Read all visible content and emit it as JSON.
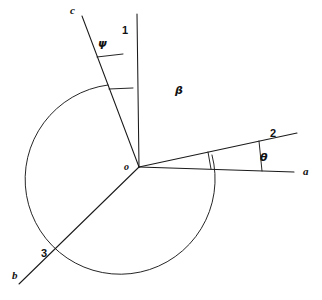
{
  "figure": {
    "type": "geometry-angle-diagram",
    "background_color": "#ffffff",
    "line_color": "#1a1a1a",
    "width": 322,
    "height": 300
  },
  "vertex": {
    "label": "o",
    "x": 139,
    "y": 167
  },
  "rays": [
    {
      "id": "ray-a",
      "label": "a",
      "label_x": 303,
      "label_y": 166,
      "x1": 139,
      "y1": 167,
      "x2": 294,
      "y2": 172
    },
    {
      "id": "ray-2",
      "label": "2",
      "label_x": 270,
      "label_y": 128,
      "x1": 139,
      "y1": 167,
      "x2": 297,
      "y2": 133
    },
    {
      "id": "ray-1",
      "label": "1",
      "label_x": 122,
      "label_y": 25,
      "x1": 139,
      "y1": 167,
      "x2": 137,
      "y2": 14
    },
    {
      "id": "ray-c",
      "label": "c",
      "label_x": 70,
      "label_y": 5,
      "x1": 139,
      "y1": 167,
      "x2": 82,
      "y2": 16
    },
    {
      "id": "ray-b",
      "label": "b",
      "label_x": 12,
      "label_y": 270,
      "x1": 139,
      "y1": 167,
      "x2": 19,
      "y2": 284
    },
    {
      "id": "ray-3",
      "label": "3",
      "label_x": 41,
      "label_y": 248,
      "x1": 139,
      "y1": 167,
      "x2": 19,
      "y2": 284
    }
  ],
  "angles": [
    {
      "id": "angle-psi",
      "symbol": "ψ",
      "label_x": 98,
      "label_y": 38,
      "between": [
        "ray-c",
        "ray-1"
      ],
      "marker": "double-tick"
    },
    {
      "id": "angle-beta",
      "symbol": "β",
      "label_x": 175,
      "label_y": 85,
      "between": [
        "ray-c",
        "ray-2"
      ],
      "marker": "arc"
    },
    {
      "id": "angle-theta",
      "symbol": "θ",
      "label_x": 260,
      "label_y": 152,
      "between": [
        "ray-a",
        "ray-2"
      ],
      "marker": "double-tick"
    }
  ],
  "arcs": {
    "beta_arc": {
      "radius": 95,
      "start_x": 108,
      "start_y": 85,
      "end_x": 212,
      "end_y": 155,
      "sweep": "counterclockwise"
    },
    "psi_ticks": [
      {
        "x1": 98,
        "y1": 58,
        "x2": 124,
        "y2": 55
      },
      {
        "x1": 109,
        "y1": 88,
        "x2": 133,
        "y2": 90
      }
    ],
    "theta_ticks": [
      {
        "x1": 210,
        "y1": 169,
        "x2": 208,
        "y2": 152
      },
      {
        "x1": 262,
        "y1": 171,
        "x2": 259,
        "y2": 140
      }
    ]
  }
}
